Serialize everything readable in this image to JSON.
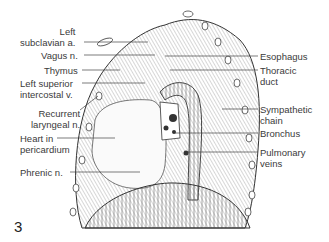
{
  "figure": {
    "number": "3"
  },
  "labels": {
    "left": [
      {
        "lines": [
          "Left",
          "subclavian a."
        ],
        "text": "Left subclavian a."
      },
      {
        "lines": [
          "Vagus n."
        ],
        "text": "Vagus n."
      },
      {
        "lines": [
          "Thymus"
        ],
        "text": "Thymus"
      },
      {
        "lines": [
          "Left superior",
          "intercostal v."
        ],
        "text": "Left superior intercostal v."
      },
      {
        "lines": [
          "Recurrent",
          "laryngeal n."
        ],
        "text": "Recurrent laryngeal n."
      },
      {
        "lines": [
          "Heart in",
          "pericardium"
        ],
        "text": "Heart in pericardium"
      },
      {
        "lines": [
          "Phrenic n."
        ],
        "text": "Phrenic n."
      }
    ],
    "right": [
      {
        "lines": [
          "Esophagus"
        ],
        "text": "Esophagus"
      },
      {
        "lines": [
          "Thoracic",
          "duct"
        ],
        "text": "Thoracic duct"
      },
      {
        "lines": [
          "Sympathetic",
          "chain"
        ],
        "text": "Sympathetic chain"
      },
      {
        "lines": [
          "Bronchus"
        ],
        "text": "Bronchus"
      },
      {
        "lines": [
          "Pulmonary",
          "veins"
        ],
        "text": "Pulmonary veins"
      }
    ]
  },
  "colors": {
    "ink": "#3a3a3a",
    "background": "#ffffff",
    "hatch": "#555555"
  }
}
